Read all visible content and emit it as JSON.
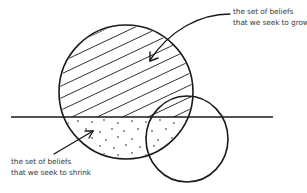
{
  "diagram": {
    "type": "venn-style belief sets diagram",
    "labels": {
      "grow": {
        "line1": "the set of beliefs",
        "line2": "that we seek to grow"
      },
      "shrink": {
        "line1": "the set of beliefs",
        "line2": "that we seek to shrink"
      }
    },
    "shapes": {
      "large_circle": {
        "cx": 126,
        "cy": 92,
        "r": 67,
        "upper_fill": "diagonal-hatch",
        "lower_fill": "dots"
      },
      "small_circle": {
        "cx": 187,
        "cy": 140,
        "r": 42,
        "fill": "none"
      },
      "horizon_line": {
        "x1": 11,
        "x2": 273,
        "y": 117
      }
    },
    "colors": {
      "stroke": "#1a1a1a",
      "text": "#3a3a3a",
      "background": "#ffffff"
    }
  }
}
